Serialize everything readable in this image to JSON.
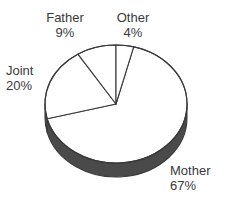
{
  "chart_data": {
    "type": "pie",
    "title": "",
    "subtitle": "",
    "xlabel": "",
    "ylabel": "",
    "legend_position": "none",
    "grid": false,
    "style": "3d-pie",
    "categories": [
      "Mother",
      "Joint",
      "Father",
      "Other"
    ],
    "values": [
      67,
      20,
      9,
      4
    ],
    "units": "%",
    "slices": [
      {
        "label": "Mother",
        "value": 67,
        "value_text": "67%",
        "start_deg": 14.4,
        "end_deg": 255.6,
        "fill": "#ffffff",
        "side_fill": "#4a4a4a"
      },
      {
        "label": "Joint",
        "value": 20,
        "value_text": "20%",
        "start_deg": 255.6,
        "end_deg": 327.6,
        "fill": "#ffffff",
        "side_fill": "#4a4a4a"
      },
      {
        "label": "Father",
        "value": 9,
        "value_text": "9%",
        "start_deg": 327.6,
        "end_deg": 360.0,
        "fill": "#ffffff",
        "side_fill": "#4a4a4a"
      },
      {
        "label": "Other",
        "value": 4,
        "value_text": "4%",
        "start_deg": 0.0,
        "end_deg": 14.4,
        "fill": "#ffffff",
        "side_fill": "#4a4a4a"
      }
    ],
    "annotations": [
      {
        "name": "Father",
        "text": "Father",
        "pct": "9%"
      },
      {
        "name": "Other",
        "text": "Other",
        "pct": "4%"
      },
      {
        "name": "Joint",
        "text": "Joint",
        "pct": "20%"
      },
      {
        "name": "Mother",
        "text": "Mother",
        "pct": "67%"
      }
    ],
    "colors": {
      "background": "#ffffff",
      "slice_fill": "#ffffff",
      "outline": "#3a3a3a",
      "depth_side": "#4a4a4a",
      "text": "#3a3a3a"
    }
  },
  "labels": {
    "father": {
      "name": "Father",
      "pct": "9%"
    },
    "other": {
      "name": "Other",
      "pct": "4%"
    },
    "joint": {
      "name": "Joint",
      "pct": "20%"
    },
    "mother": {
      "name": "Mother",
      "pct": "67%"
    }
  }
}
